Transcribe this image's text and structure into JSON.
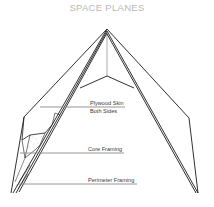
{
  "title": "SPACE PLANES",
  "labels": {
    "plywood_skin": "Plywood Skin",
    "both_sides": "Both Sides",
    "core_framing": "Core Framing",
    "perimeter_framing": "Perimeter Framing"
  },
  "colors": {
    "line": "#1a1a1a",
    "leader": "#8a8a8a",
    "title": "#b9b9b9"
  }
}
